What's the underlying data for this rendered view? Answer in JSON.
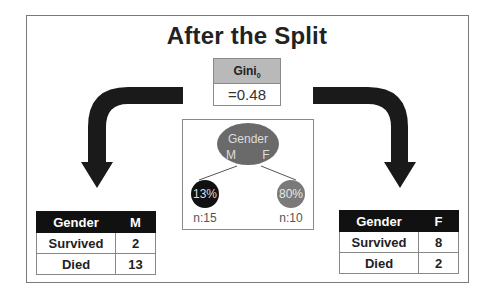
{
  "title": "After the Split",
  "gini": {
    "label": "Gini",
    "subscript": "0",
    "value": "=0.48"
  },
  "tree": {
    "root": {
      "label": "Gender",
      "left_branch": "M",
      "right_branch": "F",
      "color": "#6a6a6a"
    },
    "left_leaf": {
      "value": "13%",
      "n": "n:15",
      "color": "#111111"
    },
    "right_leaf": {
      "value": "80%",
      "n": "n:10",
      "color": "#7a7a7a"
    }
  },
  "left_table": {
    "headers": [
      "Gender",
      "M"
    ],
    "rows": [
      [
        "Survived",
        "2"
      ],
      [
        "Died",
        "13"
      ]
    ]
  },
  "right_table": {
    "headers": [
      "Gender",
      "F"
    ],
    "rows": [
      [
        "Survived",
        "8"
      ],
      [
        "Died",
        "2"
      ]
    ]
  }
}
